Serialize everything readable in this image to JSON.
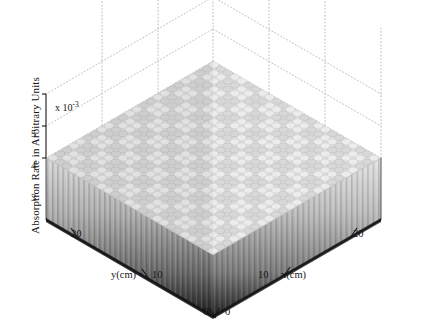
{
  "figure": {
    "kind": "3d-bar-surface-plot",
    "background_color": "#ffffff",
    "axis_line_color": "#1a1a1a",
    "grid_color": "#b9b9b9",
    "grid_style": "dotted"
  },
  "axes": {
    "z": {
      "title": "Absorption Rate in Arbitrary Units",
      "multiplier_prefix": "x 10",
      "multiplier_exponent": "-3",
      "ticks": [
        "5",
        "4",
        "3"
      ],
      "tick_values": [
        5,
        4,
        3
      ],
      "range": [
        3,
        5
      ]
    },
    "x": {
      "title": "x(cm)",
      "ticks": [
        "0",
        "10",
        "20"
      ],
      "tick_values": [
        0,
        10,
        20
      ],
      "range": [
        0,
        24
      ]
    },
    "y": {
      "title": "y(cm)",
      "ticks": [
        "0",
        "10",
        "20"
      ],
      "tick_values": [
        0,
        10,
        20
      ],
      "range": [
        0,
        24
      ]
    }
  },
  "chart_data": {
    "type": "bar",
    "title": "",
    "subtitle": "",
    "xlabel": "x(cm)",
    "ylabel": "y(cm)",
    "zlabel": "Absorption Rate in Arbitrary Units",
    "z_multiplier": 0.001,
    "zlim": [
      3,
      5
    ],
    "xlim": [
      0,
      24
    ],
    "ylim": [
      0,
      24
    ],
    "grid": true,
    "legend": null,
    "projection": "3d-isometric",
    "marker_shape": "cylinder",
    "grid_nx": 24,
    "grid_ny": 24,
    "colormap": "gray",
    "hotspot_period_x": 4,
    "hotspot_period_y": 4,
    "value_base": 3.6,
    "value_peak": 4.9,
    "note": "Dense uniform field of cylindrical bars with periodic bright maxima on a 4x4 lattice"
  },
  "labels": {
    "z_tick_5": "5",
    "z_tick_4": "4",
    "z_tick_3": "3",
    "x_tick_0": "0",
    "x_tick_10": "10",
    "x_tick_20": "20",
    "y_tick_0": "0",
    "y_tick_10": "10",
    "y_tick_20": "20",
    "x_axis_title": "x(cm)",
    "y_axis_title": "y(cm)",
    "z_axis_title": "Absorption Rate in Arbitrary Units",
    "multiplier_base": "x 10",
    "multiplier_exp": "-3"
  }
}
